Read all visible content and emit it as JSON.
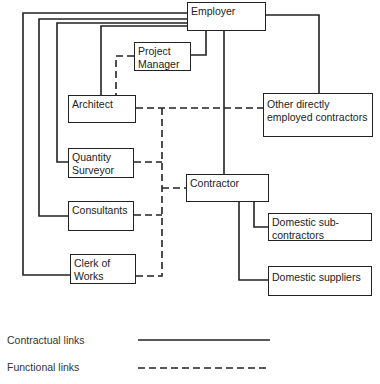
{
  "nodes": {
    "employer": "Employer",
    "project_manager": "Project\nManager",
    "architect": "Architect",
    "other_contractors": "Other directly\nemployed contractors",
    "quantity_surveyor": "Quantity\nSurveyor",
    "consultants": "Consultants",
    "contractor": "Contractor",
    "clerk_of_works": "Clerk of\nWorks",
    "domestic_subcontractors": "Domestic sub-\ncontractors",
    "domestic_suppliers": "Domestic suppliers"
  },
  "legend": {
    "contractual": "Contractual links",
    "functional": "Functional links"
  },
  "colors": {
    "line": "#222222",
    "background": "#ffffff"
  }
}
